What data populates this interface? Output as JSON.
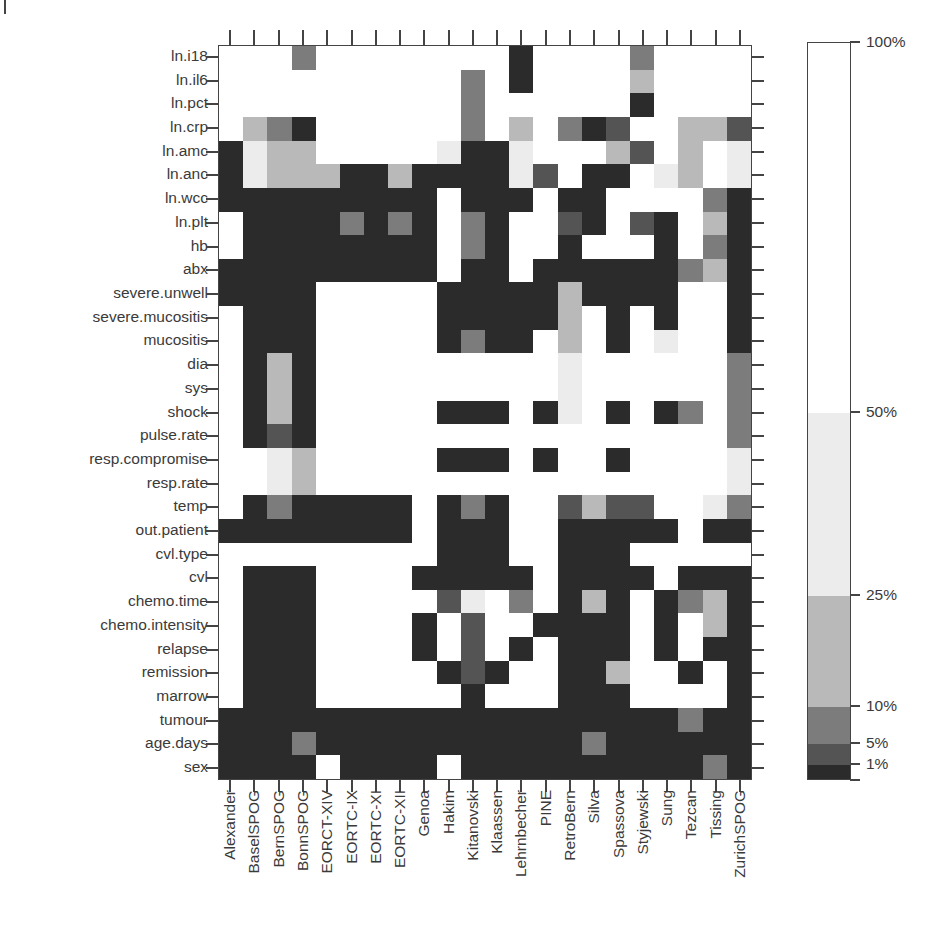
{
  "chart_data": {
    "type": "heatmap",
    "title": "",
    "xlabel": "",
    "ylabel": "",
    "x_categories": [
      "Alexander",
      "BaselSPOG",
      "BernSPOG",
      "BonnSPOG",
      "EORCT-XIV",
      "EORTC-IX",
      "EORTC-XI",
      "EORTC-XII",
      "Genoa",
      "Hakim",
      "Kitanovski",
      "Klaassen",
      "Lehrnbecher",
      "PINE",
      "RetroBern",
      "Silva",
      "Spassova",
      "Styjewski",
      "Sung",
      "Tezcan",
      "Tissing",
      "ZurichSPOG"
    ],
    "y_categories": [
      "ln.i18",
      "ln.il6",
      "ln.pct",
      "ln.crp",
      "ln.amc",
      "ln.anc",
      "ln.wcc",
      "ln.plt",
      "hb",
      "abx",
      "severe.unwell",
      "severe.mucositis",
      "mucositis",
      "dia",
      "sys",
      "shock",
      "pulse.rate",
      "resp.compromise",
      "resp.rate",
      "temp",
      "out.patient",
      "cvl.type",
      "cvl",
      "chemo.time",
      "chemo.intensity",
      "relapse",
      "remission",
      "marrow",
      "tumour",
      "age.days",
      "sex"
    ],
    "bins": [
      {
        "code": 0,
        "range": "0-1%",
        "color": "#2b2b2b"
      },
      {
        "code": 1,
        "range": "1-5%",
        "color": "#545454"
      },
      {
        "code": 2,
        "range": "5-10%",
        "color": "#7c7c7c"
      },
      {
        "code": 3,
        "range": "10-25%",
        "color": "#b9b9b9"
      },
      {
        "code": 4,
        "range": "25-50%",
        "color": "#ececec"
      },
      {
        "code": 5,
        "range": "50-100%",
        "color": "#ffffff"
      }
    ],
    "legend_ticks": [
      "100%",
      "50%",
      "25%",
      "10%",
      "5%",
      "1%"
    ],
    "values": [
      [
        5,
        5,
        5,
        2,
        5,
        5,
        5,
        5,
        5,
        5,
        5,
        5,
        0,
        5,
        5,
        5,
        5,
        2,
        5,
        5,
        5,
        5
      ],
      [
        5,
        5,
        5,
        5,
        5,
        5,
        5,
        5,
        5,
        5,
        2,
        5,
        0,
        5,
        5,
        5,
        5,
        3,
        5,
        5,
        5,
        5
      ],
      [
        5,
        5,
        5,
        5,
        5,
        5,
        5,
        5,
        5,
        5,
        2,
        5,
        5,
        5,
        5,
        5,
        5,
        0,
        5,
        5,
        5,
        5
      ],
      [
        5,
        3,
        2,
        0,
        5,
        5,
        5,
        5,
        5,
        5,
        2,
        5,
        3,
        5,
        2,
        0,
        1,
        5,
        5,
        3,
        3,
        1
      ],
      [
        0,
        4,
        3,
        3,
        5,
        5,
        5,
        5,
        5,
        4,
        0,
        0,
        4,
        5,
        5,
        5,
        3,
        1,
        5,
        3,
        5,
        4
      ],
      [
        0,
        4,
        3,
        3,
        3,
        0,
        0,
        3,
        0,
        0,
        0,
        0,
        4,
        1,
        5,
        0,
        0,
        5,
        4,
        3,
        5,
        4
      ],
      [
        0,
        0,
        0,
        0,
        0,
        0,
        0,
        0,
        0,
        5,
        0,
        0,
        0,
        5,
        0,
        0,
        5,
        5,
        5,
        5,
        2,
        0
      ],
      [
        5,
        0,
        0,
        0,
        0,
        2,
        0,
        2,
        0,
        5,
        2,
        0,
        5,
        5,
        1,
        0,
        5,
        1,
        0,
        5,
        3,
        0
      ],
      [
        5,
        0,
        0,
        0,
        0,
        0,
        0,
        0,
        0,
        5,
        2,
        0,
        5,
        5,
        0,
        5,
        5,
        5,
        0,
        5,
        2,
        0
      ],
      [
        0,
        0,
        0,
        0,
        0,
        0,
        0,
        0,
        0,
        5,
        0,
        0,
        5,
        0,
        0,
        0,
        0,
        0,
        0,
        2,
        3,
        0
      ],
      [
        0,
        0,
        0,
        0,
        5,
        5,
        5,
        5,
        5,
        0,
        0,
        0,
        0,
        0,
        3,
        0,
        0,
        0,
        0,
        5,
        5,
        0
      ],
      [
        5,
        0,
        0,
        0,
        5,
        5,
        5,
        5,
        5,
        0,
        0,
        0,
        0,
        0,
        3,
        5,
        0,
        5,
        0,
        5,
        5,
        0
      ],
      [
        5,
        0,
        0,
        0,
        5,
        5,
        5,
        5,
        5,
        0,
        2,
        0,
        0,
        5,
        3,
        5,
        0,
        5,
        4,
        5,
        5,
        0
      ],
      [
        5,
        0,
        3,
        0,
        5,
        5,
        5,
        5,
        5,
        5,
        5,
        5,
        5,
        5,
        4,
        5,
        5,
        5,
        5,
        5,
        5,
        2
      ],
      [
        5,
        0,
        3,
        0,
        5,
        5,
        5,
        5,
        5,
        5,
        5,
        5,
        5,
        5,
        4,
        5,
        5,
        5,
        5,
        5,
        5,
        2
      ],
      [
        5,
        0,
        3,
        0,
        5,
        5,
        5,
        5,
        5,
        0,
        0,
        0,
        5,
        0,
        4,
        5,
        0,
        5,
        0,
        2,
        5,
        2
      ],
      [
        5,
        0,
        1,
        0,
        5,
        5,
        5,
        5,
        5,
        5,
        5,
        5,
        5,
        5,
        5,
        5,
        5,
        5,
        5,
        5,
        5,
        2
      ],
      [
        5,
        5,
        4,
        3,
        5,
        5,
        5,
        5,
        5,
        0,
        0,
        0,
        5,
        0,
        5,
        5,
        0,
        5,
        5,
        5,
        5,
        4
      ],
      [
        5,
        5,
        4,
        3,
        5,
        5,
        5,
        5,
        5,
        5,
        5,
        5,
        5,
        5,
        5,
        5,
        5,
        5,
        5,
        5,
        5,
        4
      ],
      [
        5,
        0,
        2,
        0,
        0,
        0,
        0,
        0,
        5,
        0,
        2,
        0,
        5,
        5,
        1,
        3,
        1,
        1,
        5,
        5,
        4,
        2
      ],
      [
        0,
        0,
        0,
        0,
        0,
        0,
        0,
        0,
        5,
        0,
        0,
        0,
        5,
        5,
        0,
        0,
        0,
        0,
        0,
        5,
        0,
        0
      ],
      [
        5,
        5,
        5,
        5,
        5,
        5,
        5,
        5,
        5,
        0,
        0,
        0,
        5,
        5,
        0,
        0,
        0,
        5,
        5,
        5,
        5,
        5
      ],
      [
        5,
        0,
        0,
        0,
        5,
        5,
        5,
        5,
        0,
        0,
        0,
        0,
        0,
        5,
        0,
        0,
        0,
        0,
        5,
        0,
        0,
        0
      ],
      [
        5,
        0,
        0,
        0,
        5,
        5,
        5,
        5,
        5,
        1,
        4,
        5,
        2,
        5,
        0,
        3,
        0,
        5,
        0,
        2,
        3,
        0
      ],
      [
        5,
        0,
        0,
        0,
        5,
        5,
        5,
        5,
        0,
        5,
        1,
        5,
        5,
        0,
        0,
        0,
        0,
        5,
        0,
        5,
        3,
        0
      ],
      [
        5,
        0,
        0,
        0,
        5,
        5,
        5,
        5,
        0,
        5,
        1,
        5,
        0,
        5,
        0,
        0,
        0,
        5,
        0,
        5,
        0,
        0
      ],
      [
        5,
        0,
        0,
        0,
        5,
        5,
        5,
        5,
        5,
        0,
        1,
        0,
        5,
        5,
        0,
        0,
        3,
        5,
        5,
        0,
        5,
        0
      ],
      [
        5,
        0,
        0,
        0,
        5,
        5,
        5,
        5,
        5,
        5,
        0,
        5,
        5,
        5,
        0,
        0,
        0,
        5,
        5,
        5,
        5,
        0
      ],
      [
        0,
        0,
        0,
        0,
        0,
        0,
        0,
        0,
        0,
        0,
        0,
        0,
        0,
        0,
        0,
        0,
        0,
        0,
        0,
        2,
        0,
        0
      ],
      [
        0,
        0,
        0,
        2,
        0,
        0,
        0,
        0,
        0,
        0,
        0,
        0,
        0,
        0,
        0,
        2,
        0,
        0,
        0,
        0,
        0,
        0
      ],
      [
        0,
        0,
        0,
        0,
        5,
        0,
        0,
        0,
        0,
        5,
        0,
        0,
        0,
        0,
        0,
        0,
        0,
        0,
        0,
        0,
        2,
        0
      ]
    ],
    "legend": {
      "position": "right",
      "bands": [
        {
          "from": 0,
          "to": 1,
          "color": "#2b2b2b"
        },
        {
          "from": 1,
          "to": 5,
          "color": "#545454"
        },
        {
          "from": 5,
          "to": 10,
          "color": "#7c7c7c"
        },
        {
          "from": 10,
          "to": 25,
          "color": "#b9b9b9"
        },
        {
          "from": 25,
          "to": 50,
          "color": "#ececec"
        },
        {
          "from": 50,
          "to": 100,
          "color": "#ffffff"
        }
      ],
      "ticks": [
        {
          "label": "100%",
          "y": 42
        },
        {
          "label": "50%",
          "y": 412
        },
        {
          "label": "25%",
          "y": 595
        },
        {
          "label": "10%",
          "y": 706
        },
        {
          "label": "5%",
          "y": 743
        },
        {
          "label": "1%",
          "y": 764
        }
      ]
    },
    "grid": false
  }
}
